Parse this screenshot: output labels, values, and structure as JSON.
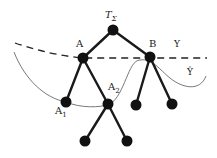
{
  "diagram": {
    "type": "tree",
    "colors": {
      "edge": "#1a1a1a",
      "node": "#111111",
      "curve": "#555555",
      "background": "#ffffff"
    },
    "labels": {
      "root": "T",
      "root_sub": "Σ",
      "a": "A",
      "b": "B",
      "a1": "A",
      "a1_sub": "1",
      "a2": "A",
      "a2_sub": "2",
      "y": "Y",
      "y_hat": "Ŷ"
    },
    "nodes": [
      {
        "id": "root",
        "x": 113,
        "y": 30
      },
      {
        "id": "A",
        "x": 83,
        "y": 58
      },
      {
        "id": "B",
        "x": 150,
        "y": 57
      },
      {
        "id": "A1",
        "x": 66,
        "y": 102
      },
      {
        "id": "A2",
        "x": 108,
        "y": 104
      },
      {
        "id": "B1",
        "x": 136,
        "y": 105
      },
      {
        "id": "B2",
        "x": 172,
        "y": 104
      },
      {
        "id": "A2a",
        "x": 85,
        "y": 141
      },
      {
        "id": "A2b",
        "x": 127,
        "y": 141
      }
    ],
    "edges": [
      [
        "root",
        "A"
      ],
      [
        "root",
        "B"
      ],
      [
        "A",
        "A1"
      ],
      [
        "A",
        "A2"
      ],
      [
        "B",
        "B1"
      ],
      [
        "B",
        "B2"
      ],
      [
        "A2",
        "A2a"
      ],
      [
        "A2",
        "A2b"
      ]
    ]
  }
}
